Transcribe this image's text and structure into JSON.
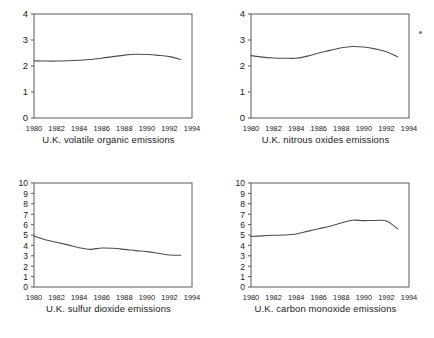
{
  "figure": {
    "background": "#ffffff",
    "line_color": "#4d4d4d",
    "axis_color": "#5a5a5a",
    "text_color": "#1a1a1a",
    "panel_count": 4,
    "layout": "2x2 grid of line charts"
  },
  "artifact": {
    "name": "scan-speck",
    "description": "small grey speck near top right of nitrous oxides panel"
  },
  "chart_data": [
    {
      "type": "line",
      "title": "U.K. volatile organic emissions",
      "xlabel": "",
      "ylabel": "",
      "xlim": [
        1980,
        1994
      ],
      "ylim": [
        0,
        4
      ],
      "grid": false,
      "legend": "none",
      "xticks": [
        1980,
        1982,
        1984,
        1986,
        1988,
        1990,
        1992,
        1994
      ],
      "yticks": [
        0,
        1,
        2,
        3,
        4
      ],
      "x": [
        1980,
        1981,
        1982,
        1983,
        1984,
        1985,
        1986,
        1987,
        1988,
        1989,
        1990,
        1991,
        1992,
        1993
      ],
      "values": [
        2.2,
        2.19,
        2.19,
        2.2,
        2.22,
        2.25,
        2.3,
        2.36,
        2.42,
        2.45,
        2.44,
        2.41,
        2.36,
        2.25
      ]
    },
    {
      "type": "line",
      "title": "U.K. nitrous oxides emissions",
      "xlabel": "",
      "ylabel": "",
      "xlim": [
        1980,
        1994
      ],
      "ylim": [
        0,
        4
      ],
      "grid": false,
      "legend": "none",
      "xticks": [
        1980,
        1982,
        1984,
        1986,
        1988,
        1990,
        1992,
        1994
      ],
      "yticks": [
        0,
        1,
        2,
        3,
        4
      ],
      "x": [
        1980,
        1981,
        1982,
        1983,
        1984,
        1985,
        1986,
        1987,
        1988,
        1989,
        1990,
        1991,
        1992,
        1993
      ],
      "values": [
        2.4,
        2.34,
        2.31,
        2.3,
        2.3,
        2.38,
        2.5,
        2.6,
        2.7,
        2.75,
        2.73,
        2.66,
        2.55,
        2.35
      ]
    },
    {
      "type": "line",
      "title": "U.K. sulfur dioxide emissions",
      "xlabel": "",
      "ylabel": "",
      "xlim": [
        1980,
        1994
      ],
      "ylim": [
        0,
        10
      ],
      "grid": false,
      "legend": "none",
      "xticks": [
        1980,
        1982,
        1984,
        1986,
        1988,
        1990,
        1992,
        1994
      ],
      "yticks": [
        0,
        1,
        2,
        3,
        4,
        5,
        6,
        7,
        8,
        9,
        10
      ],
      "x": [
        1980,
        1981,
        1982,
        1983,
        1984,
        1985,
        1986,
        1987,
        1988,
        1989,
        1990,
        1991,
        1992,
        1993
      ],
      "values": [
        4.9,
        4.55,
        4.3,
        4.05,
        3.78,
        3.62,
        3.75,
        3.72,
        3.62,
        3.5,
        3.4,
        3.25,
        3.08,
        3.05
      ]
    },
    {
      "type": "line",
      "title": "U.K. carbon monoxide emissions",
      "xlabel": "",
      "ylabel": "",
      "xlim": [
        1980,
        1994
      ],
      "ylim": [
        0,
        10
      ],
      "grid": false,
      "legend": "none",
      "xticks": [
        1980,
        1982,
        1984,
        1986,
        1988,
        1990,
        1992,
        1994
      ],
      "yticks": [
        0,
        1,
        2,
        3,
        4,
        5,
        6,
        7,
        8,
        9,
        10
      ],
      "x": [
        1980,
        1981,
        1982,
        1983,
        1984,
        1985,
        1986,
        1987,
        1988,
        1989,
        1990,
        1991,
        1992,
        1993
      ],
      "values": [
        4.85,
        4.92,
        4.97,
        5.0,
        5.1,
        5.35,
        5.6,
        5.85,
        6.15,
        6.42,
        6.38,
        6.4,
        6.35,
        5.6
      ]
    }
  ]
}
